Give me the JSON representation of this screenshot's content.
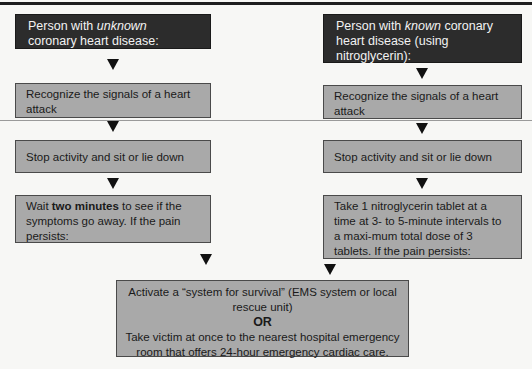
{
  "left_column": {
    "header": {
      "prefix": "Person with ",
      "emphasis": "unknown",
      "suffix": " coronary heart disease:"
    },
    "steps": [
      {
        "text": "Recognize the signals of a heart attack"
      },
      {
        "text": "Stop activity and sit or lie down"
      },
      {
        "prefix": "Wait ",
        "bold": "two minutes",
        "suffix": " to see if the symptoms go away. If the pain persists:"
      }
    ]
  },
  "right_column": {
    "header": {
      "prefix": "Person with ",
      "emphasis": "known",
      "suffix": " coronary heart disease (using nitroglycerin):"
    },
    "steps": [
      {
        "text": "Recognize the signals of a heart attack"
      },
      {
        "text": "Stop activity and sit or lie down"
      },
      {
        "text": "Take 1 nitroglycerin tablet at a time at 3- to 5-minute intervals to a maxi-mum total dose of 3 tablets. If the pain persists:"
      }
    ]
  },
  "final_box": {
    "option_1": "Activate a “system for survival” (EMS system or local rescue unit)",
    "separator": "OR",
    "option_2": "Take victim at once to the nearest hospital emergency room that offers 24-hour emergency cardiac care."
  },
  "colors": {
    "header_fill": "#2c2c2c",
    "step_fill": "#a9a9a9",
    "arrow": "#111111"
  }
}
